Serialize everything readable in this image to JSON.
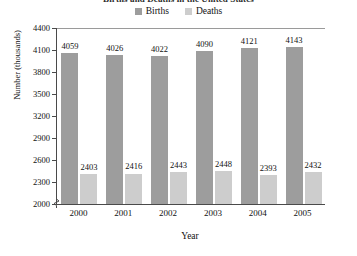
{
  "chart_data": {
    "type": "bar",
    "title": "Births and Deaths in the United States",
    "xlabel": "Year",
    "ylabel": "Number (thousands)",
    "categories": [
      "2000",
      "2001",
      "2002",
      "2003",
      "2004",
      "2005"
    ],
    "series": [
      {
        "name": "Births",
        "color": "#9d9d9d",
        "values": [
          4059,
          4026,
          4022,
          4090,
          4121,
          4143
        ]
      },
      {
        "name": "Deaths",
        "color": "#cdcdcd",
        "values": [
          2403,
          2416,
          2443,
          2448,
          2393,
          2432
        ]
      }
    ],
    "ylim": [
      2000,
      4400
    ],
    "ytick_labels": [
      "4400",
      "4100",
      "3800",
      "3500",
      "3200",
      "2900",
      "2600",
      "2300",
      "2000"
    ],
    "ytick_values": [
      4400,
      4100,
      3800,
      3500,
      3200,
      2900,
      2600,
      2300,
      2000
    ],
    "y_axis_break": true,
    "grid": false,
    "legend_position": "top-center",
    "data_labels": true
  },
  "legend": {
    "entries": [
      {
        "label": "Births",
        "color": "#9d9d9d"
      },
      {
        "label": "Deaths",
        "color": "#cdcdcd"
      }
    ]
  }
}
